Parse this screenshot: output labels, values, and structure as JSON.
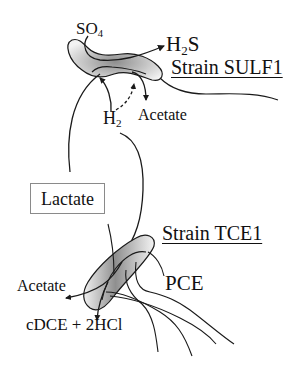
{
  "diagram": {
    "type": "microbial-interaction-schematic",
    "colors": {
      "stroke": "#1a1a1a",
      "cell_fill_dark": "#9a9a9a",
      "cell_fill_light": "#f2f2f2",
      "box_border": "#8a8a8a"
    },
    "strain_sulf1": {
      "name": "Strain SULF1",
      "inputs": {
        "so4_base": "SO",
        "so4_sub": "4"
      },
      "outputs": {
        "h2s_h": "H",
        "h2s_sub": "2",
        "h2s_s": "S",
        "acetate": "Acetate"
      },
      "h2": {
        "base": "H",
        "sub": "2"
      }
    },
    "lactate_box": {
      "label": "Lactate"
    },
    "strain_tce1": {
      "name": "Strain TCE1",
      "input": "PCE",
      "outputs": {
        "acetate": "Acetate",
        "products": "cDCE + 2HCl"
      }
    }
  }
}
